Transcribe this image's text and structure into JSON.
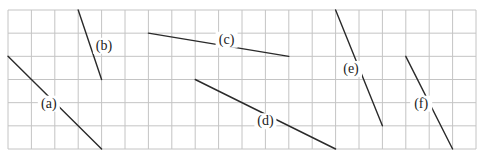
{
  "figure": {
    "grid": {
      "columns": 20,
      "rows": 6
    },
    "line_color": "#2a2a2a",
    "grid_color": "#c4c4c4",
    "segments": [
      {
        "label": "(a)",
        "start": [
          0,
          2
        ],
        "end": [
          4,
          6
        ]
      },
      {
        "label": "(b)",
        "start": [
          3,
          0
        ],
        "end": [
          4,
          3
        ]
      },
      {
        "label": "(c)",
        "start": [
          6,
          1
        ],
        "end": [
          12,
          2
        ]
      },
      {
        "label": "(d)",
        "start": [
          8,
          3
        ],
        "end": [
          14,
          6
        ]
      },
      {
        "label": "(e)",
        "start": [
          14,
          0
        ],
        "end": [
          16,
          5
        ]
      },
      {
        "label": "(f)",
        "start": [
          17,
          2
        ],
        "end": [
          19,
          6
        ]
      }
    ]
  }
}
